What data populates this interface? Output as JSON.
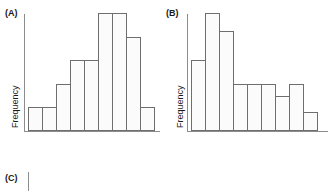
{
  "figure": {
    "background_color": "#ffffff",
    "bar_fill_color": "#fbfbfb",
    "bar_stroke_color": "#6e6e6e",
    "axis_color": "#8c8c8c",
    "text_color": "#1a1a1a"
  },
  "panels": {
    "a": {
      "label": "(A)",
      "ylabel": "Frequency"
    },
    "b": {
      "label": "(B)",
      "ylabel": "Frequency"
    },
    "c": {
      "label": "(C)"
    }
  },
  "chart_data": [
    {
      "type": "bar",
      "title": "(A)",
      "subtitle": "",
      "xlabel": "",
      "ylabel": "Frequency",
      "categories": [
        "1",
        "2",
        "3",
        "4",
        "5",
        "6",
        "7",
        "8",
        "9"
      ],
      "values": [
        2,
        2,
        4,
        6,
        6,
        10,
        10,
        8,
        2
      ],
      "ylim": [
        0,
        10
      ],
      "xlim": [
        0,
        9
      ],
      "grid": false,
      "legend": "none",
      "shape": "unimodal-left-skewed-rise",
      "tick_labels": {
        "x": [],
        "y": []
      }
    },
    {
      "type": "bar",
      "title": "(B)",
      "subtitle": "",
      "xlabel": "",
      "ylabel": "Frequency",
      "categories": [
        "1",
        "2",
        "3",
        "4",
        "5",
        "6",
        "7",
        "8",
        "9"
      ],
      "values": [
        6,
        10,
        8.5,
        4,
        4,
        4,
        3,
        4,
        1.6
      ],
      "ylim": [
        0,
        10
      ],
      "xlim": [
        0,
        9
      ],
      "grid": false,
      "legend": "none",
      "shape": "right-skewed-decreasing",
      "tick_labels": {
        "x": [],
        "y": []
      }
    }
  ]
}
